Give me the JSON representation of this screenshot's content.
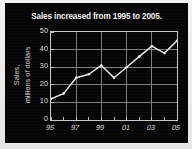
{
  "chart_data": {
    "type": "line",
    "title": "Sales increased from 1995 to 2005.",
    "xlabel": "",
    "ylabel": "Sales, millions of dollars",
    "ylabel_lines": [
      "Sales,",
      "millions of dollars"
    ],
    "x": [
      "95",
      "96",
      "97",
      "98",
      "99",
      "00",
      "01",
      "02",
      "03",
      "04",
      "05"
    ],
    "x_tick_labels": [
      "95",
      "97",
      "99",
      "01",
      "03",
      "05"
    ],
    "x_tick_values": [
      1995,
      1997,
      1999,
      2001,
      2003,
      2005
    ],
    "values": [
      12,
      15,
      24,
      26,
      31,
      24,
      30,
      36,
      42,
      38,
      45
    ],
    "series": [
      {
        "name": "Sales",
        "values": [
          12,
          15,
          24,
          26,
          31,
          24,
          30,
          36,
          42,
          38,
          45
        ]
      }
    ],
    "xlim": [
      1995,
      2005
    ],
    "ylim": [
      0,
      50
    ],
    "y_tick_labels": [
      "0",
      "10",
      "20",
      "30",
      "40",
      "50"
    ],
    "y_tick_values": [
      0,
      10,
      20,
      30,
      40,
      50
    ],
    "grid": true,
    "legend": "none",
    "marker": "dot",
    "colors": {
      "background": "#050505",
      "line": "#e8e8e8",
      "grid": "#8c8c8c",
      "axis": "#c9c9c9",
      "text": "#dcdcdc",
      "title": "#f0f0f0"
    }
  }
}
